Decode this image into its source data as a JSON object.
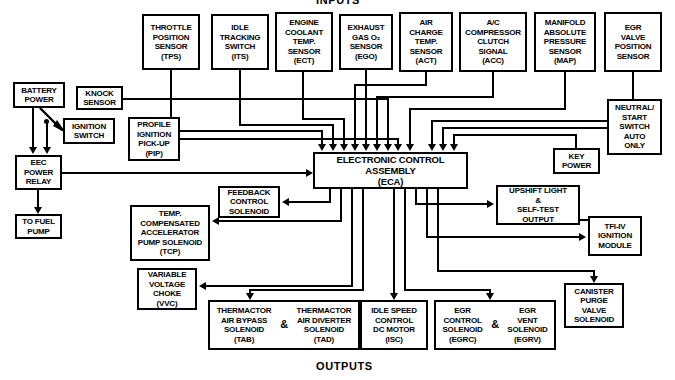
{
  "diagram": {
    "title_top": "INPUTS",
    "title_bottom": "OUTPUTS"
  },
  "inputs_top_row": [
    {
      "id": "tps",
      "lines": [
        "THROTTLE",
        "POSITION",
        "SENSOR",
        "(TPS)"
      ]
    },
    {
      "id": "its",
      "lines": [
        "IDLE",
        "TRACKING",
        "SWITCH",
        "(ITS)"
      ]
    },
    {
      "id": "ect",
      "lines": [
        "ENGINE",
        "COOLANT",
        "TEMP.",
        "SENSOR",
        "(ECT)"
      ]
    },
    {
      "id": "ego",
      "lines": [
        "EXHAUST",
        "GAS O₂",
        "SENSOR",
        "(EGO)"
      ]
    },
    {
      "id": "act",
      "lines": [
        "AIR",
        "CHARGE",
        "TEMP.",
        "SENSOR",
        "(ACT)"
      ]
    },
    {
      "id": "acc",
      "lines": [
        "A/C",
        "COMPRESSOR",
        "CLUTCH",
        "SIGNAL",
        "(ACC)"
      ]
    },
    {
      "id": "map",
      "lines": [
        "MANIFOLD",
        "ABSOLUTE",
        "PRESSURE",
        "SENSOR",
        "(MAP)"
      ]
    },
    {
      "id": "evp",
      "lines": [
        "EGR",
        "VALVE",
        "POSITION",
        "SENSOR",
        "(EVP)"
      ]
    }
  ],
  "inputs_left": [
    {
      "id": "battery_power",
      "lines": [
        "BATTERY",
        "POWER"
      ]
    },
    {
      "id": "ignition_switch",
      "lines": [
        "IGNITION",
        "SWITCH"
      ]
    },
    {
      "id": "eec_power_relay",
      "lines": [
        "EEC",
        "POWER",
        "RELAY"
      ]
    },
    {
      "id": "to_fuel_pump",
      "lines": [
        "TO FUEL",
        "PUMP"
      ]
    },
    {
      "id": "knock_sensor",
      "lines": [
        "KNOCK",
        "SENSOR"
      ]
    },
    {
      "id": "pip",
      "lines": [
        "PROFILE",
        "IGNITION",
        "PICK-UP",
        "(PIP)"
      ]
    }
  ],
  "inputs_right": [
    {
      "id": "neutral_start_switch",
      "lines": [
        "NEUTRAL/",
        "START",
        "SWITCH",
        "AUTO",
        "ONLY"
      ]
    },
    {
      "id": "key_power",
      "lines": [
        "KEY",
        "POWER"
      ]
    }
  ],
  "controller": {
    "id": "eca",
    "lines": [
      "ELECTRONIC CONTROL",
      "ASSEMBLY",
      "(ECA)"
    ]
  },
  "outputs": [
    {
      "id": "feedback_control_solenoid",
      "lines": [
        "FEEDBACK",
        "CONTROL",
        "SOLENOID"
      ]
    },
    {
      "id": "tcp",
      "lines": [
        "TEMP.",
        "COMPENSATED",
        "ACCELERATOR",
        "PUMP SOLENOID",
        "(TCP)"
      ]
    },
    {
      "id": "vvc",
      "lines": [
        "VARIABLE",
        "VOLTAGE",
        "CHOKE",
        "(VVC)"
      ]
    },
    {
      "id": "isc",
      "lines": [
        "IDLE SPEED",
        "CONTROL",
        "DC MOTOR",
        "(ISC)"
      ]
    },
    {
      "id": "upshift_light",
      "lines": [
        "UPSHIFT LIGHT",
        "&",
        "SELF-TEST",
        "OUTPUT"
      ]
    },
    {
      "id": "tfi_iv",
      "lines": [
        "TFI-IV",
        "IGNITION",
        "MODULE"
      ]
    },
    {
      "id": "canister_purge",
      "lines": [
        "CANISTER",
        "PURGE",
        "VALVE",
        "SOLENOID"
      ]
    }
  ],
  "outputs_dual": [
    {
      "id": "thermactor_pair",
      "amp": "&",
      "left": [
        "THERMACTOR",
        "AIR BYPASS",
        "SOLENOID",
        "(TAB)"
      ],
      "right": [
        "THERMACTOR",
        "AIR DIVERTER",
        "SOLENOID",
        "(TAD)"
      ]
    },
    {
      "id": "egr_pair",
      "amp": "&",
      "left": [
        "EGR",
        "CONTROL",
        "SOLENOID",
        "(EGRC)"
      ],
      "right": [
        "EGR",
        "VENT",
        "SOLENOID",
        "(EGRV)"
      ]
    }
  ],
  "colors": {
    "line": "#000000",
    "background": "#ffffff",
    "text": "#000000"
  }
}
